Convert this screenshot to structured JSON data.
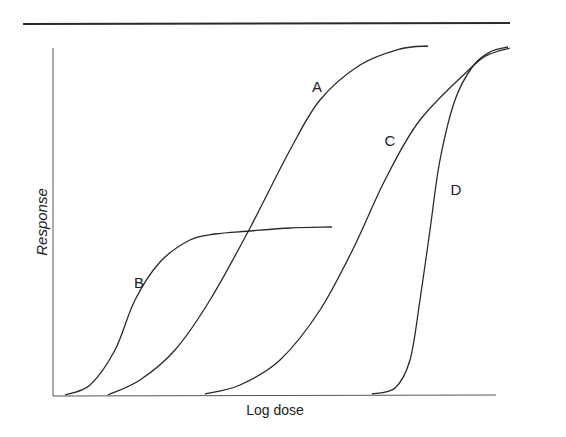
{
  "chart_data": {
    "type": "line",
    "title": "",
    "xlabel": "Log dose",
    "ylabel": "Response",
    "grid": false,
    "legend": "none (curves labeled inline)",
    "xlim": [
      0,
      1
    ],
    "ylim": [
      0,
      1
    ],
    "series": [
      {
        "name": "A",
        "description": "sigmoid, moderate potency, full efficacy",
        "label_pos": [
          317,
          92
        ],
        "points_px": [
          [
            108,
            395
          ],
          [
            140,
            380
          ],
          [
            175,
            350
          ],
          [
            210,
            300
          ],
          [
            250,
            228
          ],
          [
            290,
            150
          ],
          [
            320,
            100
          ],
          [
            360,
            65
          ],
          [
            400,
            49
          ],
          [
            428,
            46
          ]
        ]
      },
      {
        "name": "B",
        "description": "sigmoid, highest potency, low efficacy (partial agonist)",
        "label_pos": [
          139,
          288
        ],
        "points_px": [
          [
            65,
            395
          ],
          [
            90,
            385
          ],
          [
            115,
            350
          ],
          [
            135,
            300
          ],
          [
            160,
            262
          ],
          [
            190,
            240
          ],
          [
            215,
            234
          ],
          [
            250,
            231
          ],
          [
            290,
            228
          ],
          [
            332,
            227
          ]
        ]
      },
      {
        "name": "C",
        "description": "sigmoid, lower potency, full efficacy",
        "label_pos": [
          390,
          146
        ],
        "points_px": [
          [
            205,
            394
          ],
          [
            240,
            385
          ],
          [
            280,
            360
          ],
          [
            320,
            310
          ],
          [
            355,
            245
          ],
          [
            385,
            180
          ],
          [
            420,
            120
          ],
          [
            473,
            66
          ],
          [
            490,
            54
          ],
          [
            510,
            48
          ]
        ]
      },
      {
        "name": "D",
        "description": "steep sigmoid, lowest potency, full efficacy",
        "label_pos": [
          456,
          195
        ],
        "points_px": [
          [
            372,
            394
          ],
          [
            395,
            388
          ],
          [
            410,
            360
          ],
          [
            420,
            300
          ],
          [
            430,
            230
          ],
          [
            440,
            160
          ],
          [
            455,
            100
          ],
          [
            473,
            66
          ],
          [
            490,
            52
          ],
          [
            508,
            47
          ]
        ]
      }
    ]
  },
  "figure": {
    "xlabel": "Log dose",
    "ylabel": "Response",
    "curve_labels": {
      "A": "A",
      "B": "B",
      "C": "C",
      "D": "D"
    }
  }
}
